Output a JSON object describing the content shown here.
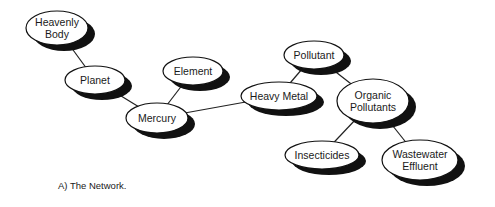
{
  "diagram": {
    "type": "network",
    "colors": {
      "fill": "#ffffff",
      "stroke": "#111111",
      "shadow": "#111111",
      "edge": "#222222"
    },
    "shadow_offset": [
      7,
      6
    ],
    "nodes": [
      {
        "id": "heavenly_body",
        "lines": [
          "Heavenly",
          "Body"
        ],
        "cx": 57,
        "cy": 28,
        "rx": 31,
        "ry": 17
      },
      {
        "id": "planet",
        "lines": [
          "Planet"
        ],
        "cx": 95,
        "cy": 80,
        "rx": 30,
        "ry": 14
      },
      {
        "id": "mercury",
        "lines": [
          "Mercury"
        ],
        "cx": 157,
        "cy": 118,
        "rx": 31,
        "ry": 15
      },
      {
        "id": "element",
        "lines": [
          "Element"
        ],
        "cx": 193,
        "cy": 71,
        "rx": 30,
        "ry": 14
      },
      {
        "id": "heavy_metal",
        "lines": [
          "Heavy Metal"
        ],
        "cx": 279,
        "cy": 96,
        "rx": 38,
        "ry": 14
      },
      {
        "id": "pollutant",
        "lines": [
          "Pollutant"
        ],
        "cx": 314,
        "cy": 55,
        "rx": 30,
        "ry": 14
      },
      {
        "id": "organic_pollutants",
        "lines": [
          "Organic",
          "Pollutants"
        ],
        "cx": 373,
        "cy": 101,
        "rx": 36,
        "ry": 22
      },
      {
        "id": "insecticides",
        "lines": [
          "Insecticides"
        ],
        "cx": 322,
        "cy": 155,
        "rx": 37,
        "ry": 14
      },
      {
        "id": "wastewater_effluent",
        "lines": [
          "Wastewater",
          "Effluent"
        ],
        "cx": 420,
        "cy": 160,
        "rx": 38,
        "ry": 20
      }
    ],
    "edges": [
      [
        "heavenly_body",
        "planet"
      ],
      [
        "planet",
        "mercury"
      ],
      [
        "element",
        "mercury"
      ],
      [
        "mercury",
        "heavy_metal"
      ],
      [
        "heavy_metal",
        "pollutant"
      ],
      [
        "pollutant",
        "organic_pollutants"
      ],
      [
        "organic_pollutants",
        "insecticides"
      ],
      [
        "organic_pollutants",
        "wastewater_effluent"
      ]
    ]
  },
  "caption": "A)  The Network."
}
